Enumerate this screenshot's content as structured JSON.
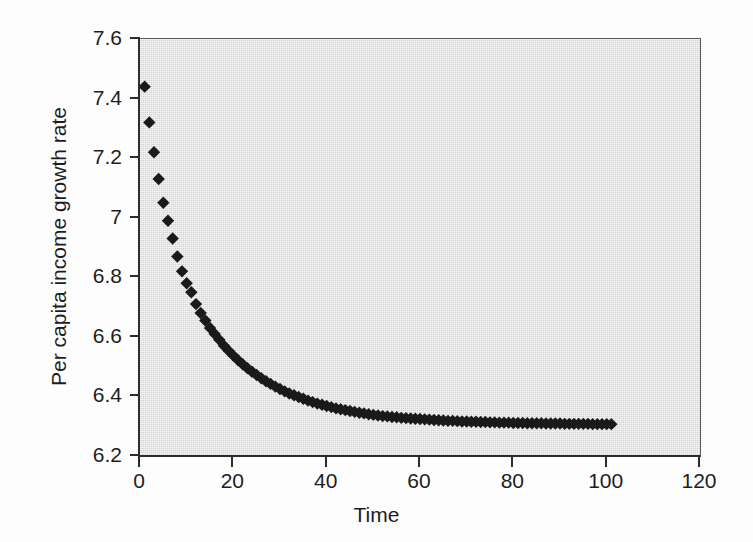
{
  "chart_data": {
    "type": "scatter",
    "title": "",
    "xlabel": "Time",
    "ylabel": "Per capita income growth rate",
    "xlim": [
      0,
      120
    ],
    "ylim": [
      6.2,
      7.6
    ],
    "xticks": [
      0,
      20,
      40,
      60,
      80,
      100,
      120
    ],
    "xtick_labels": [
      "0",
      "20",
      "40",
      "60",
      "80",
      "100",
      "120"
    ],
    "yticks": [
      6.2,
      6.4,
      6.6,
      6.8,
      7,
      7.2,
      7.4,
      7.6
    ],
    "ytick_labels": [
      "6.2",
      "6.4",
      "6.6",
      "6.8",
      "7",
      "7.2",
      "7.4",
      "7.6"
    ],
    "grid": false,
    "legend": null,
    "marker": "diamond",
    "marker_color": "#1a1a1a",
    "plot_background": "#d4d4d4",
    "figure_background": "#ffffff",
    "series": [
      {
        "name": "Per capita income growth rate",
        "x": [
          1,
          2,
          3,
          4,
          5,
          6,
          7,
          8,
          9,
          10,
          11,
          12,
          13,
          14,
          15,
          16,
          17,
          18,
          19,
          20,
          21,
          22,
          23,
          24,
          25,
          26,
          27,
          28,
          29,
          30,
          31,
          32,
          33,
          34,
          35,
          36,
          37,
          38,
          39,
          40,
          41,
          42,
          43,
          44,
          45,
          46,
          47,
          48,
          49,
          50,
          51,
          52,
          53,
          54,
          55,
          56,
          57,
          58,
          59,
          60,
          61,
          62,
          63,
          64,
          65,
          66,
          67,
          68,
          69,
          70,
          71,
          72,
          73,
          74,
          75,
          76,
          77,
          78,
          79,
          80,
          81,
          82,
          83,
          84,
          85,
          86,
          87,
          88,
          89,
          90,
          91,
          92,
          93,
          94,
          95,
          96,
          97,
          98,
          99,
          100,
          101
        ],
        "y": [
          7.44,
          7.32,
          7.22,
          7.13,
          7.05,
          6.99,
          6.93,
          6.87,
          6.82,
          6.78,
          6.75,
          6.71,
          6.68,
          6.655,
          6.63,
          6.61,
          6.59,
          6.57,
          6.553,
          6.537,
          6.522,
          6.508,
          6.495,
          6.483,
          6.472,
          6.461,
          6.451,
          6.442,
          6.433,
          6.425,
          6.417,
          6.41,
          6.404,
          6.398,
          6.392,
          6.386,
          6.381,
          6.376,
          6.372,
          6.368,
          6.364,
          6.36,
          6.357,
          6.354,
          6.351,
          6.348,
          6.345,
          6.343,
          6.34,
          6.338,
          6.336,
          6.334,
          6.333,
          6.331,
          6.33,
          6.328,
          6.327,
          6.326,
          6.325,
          6.324,
          6.323,
          6.322,
          6.321,
          6.32,
          6.319,
          6.318,
          6.318,
          6.317,
          6.316,
          6.316,
          6.315,
          6.315,
          6.314,
          6.314,
          6.313,
          6.313,
          6.312,
          6.312,
          6.312,
          6.311,
          6.311,
          6.311,
          6.31,
          6.31,
          6.31,
          6.31,
          6.309,
          6.309,
          6.309,
          6.309,
          6.308,
          6.308,
          6.308,
          6.308,
          6.308,
          6.308,
          6.307,
          6.307,
          6.307,
          6.307,
          6.307
        ]
      }
    ],
    "annotations": [],
    "asymptote": 6.3,
    "initial_value": 7.44,
    "final_value": 6.307
  },
  "axes": {
    "x_title": "Time",
    "y_title": "Per capita income growth rate"
  }
}
